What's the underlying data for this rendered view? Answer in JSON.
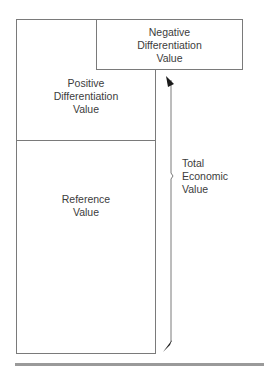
{
  "diagram": {
    "boxes": {
      "negative_differentiation": {
        "lines": [
          "Negative",
          "Differentiation",
          "Value"
        ]
      },
      "positive_differentiation": {
        "lines": [
          "Positive",
          "Differentiation",
          "Value"
        ]
      },
      "reference": {
        "lines": [
          "Reference",
          "Value"
        ]
      }
    },
    "total_label": {
      "lines": [
        "Total",
        "Economic",
        "Value"
      ]
    },
    "arrow": {
      "type": "double-headed",
      "direction": "vertical"
    },
    "colors": {
      "stroke": "#7a7a7a",
      "text": "#3c3c3c",
      "arrowhead": "#1a1a1a",
      "rule": "#9a9a9a"
    }
  }
}
